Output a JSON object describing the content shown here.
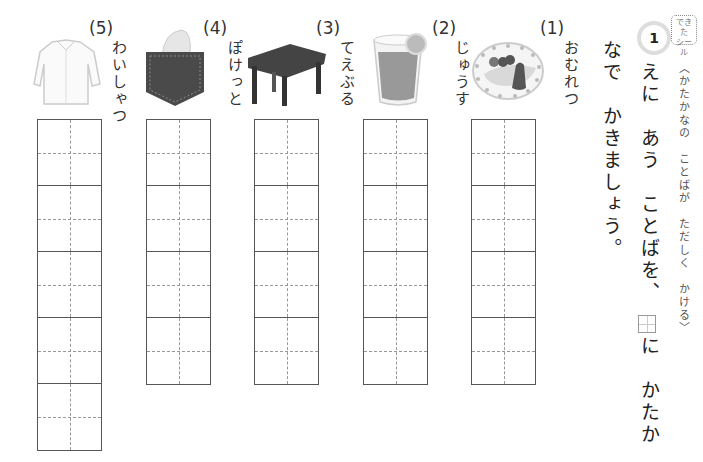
{
  "header": {
    "problem_number": "1",
    "sticker_label_line1": "できた",
    "sticker_label_line2": "シール",
    "subtitle": "〈かたかなの　ことばが　ただしく　かける〉"
  },
  "instruction": {
    "line1_part1": "えに　あう　ことばを、",
    "line1_part2": "に　かたか",
    "line2": "なで　かきましょう。"
  },
  "items": [
    {
      "label": "(1)",
      "word": "おむれつ",
      "image": "omelette-icon",
      "boxes": 4
    },
    {
      "label": "(2)",
      "word": "じゅうす",
      "image": "juice-icon",
      "boxes": 4
    },
    {
      "label": "(3)",
      "word": "てえぶる",
      "image": "table-icon",
      "boxes": 4
    },
    {
      "label": "(4)",
      "word": "ぽけっと",
      "image": "pocket-icon",
      "boxes": 4
    },
    {
      "label": "(5)",
      "word": "わいしゃつ",
      "image": "shirt-icon",
      "boxes": 5
    }
  ]
}
